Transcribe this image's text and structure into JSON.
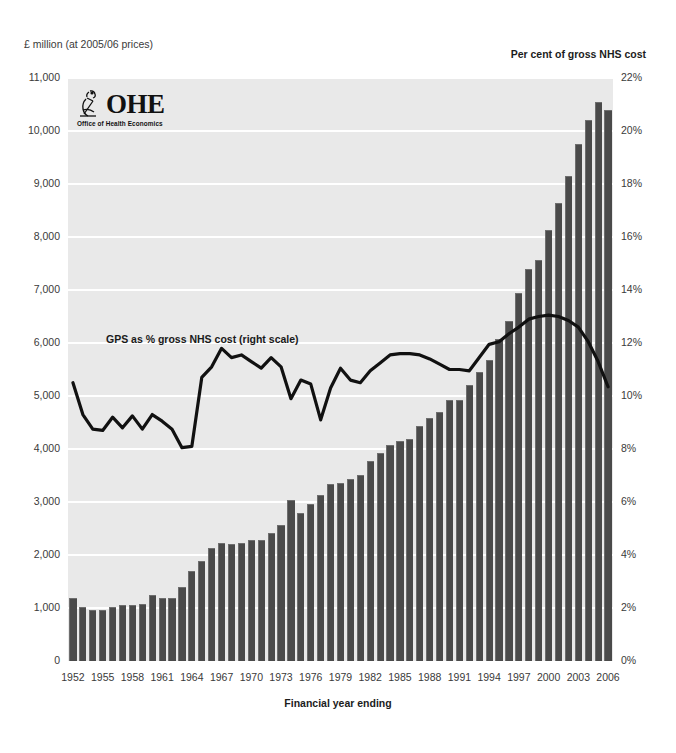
{
  "clipped_header": "",
  "axis": {
    "left_caption": "£ million (at 2005/06 prices)",
    "right_caption": "Per cent of gross NHS cost",
    "x_title": "Financial year ending"
  },
  "logo": {
    "name": "OHE",
    "subtitle": "Office of Health Economics",
    "mark": "microscope-icon"
  },
  "series_label": "GPS as % gross NHS cost (right scale)",
  "colors": {
    "bar": "#4a4a4a",
    "bar_edge": "#6e6e6e",
    "line": "#111111",
    "plot_background": "#e9e9e9",
    "gridline": "#ffffff",
    "text": "#2b2b2b"
  },
  "chart_data": {
    "type": "bar",
    "title": "",
    "subtitle": "",
    "xlabel": "Financial year ending",
    "ylabel": "£ million (at 2005/06 prices)",
    "y2label": "Per cent of gross NHS cost",
    "ylim": [
      0,
      11000
    ],
    "y2lim": [
      0,
      22
    ],
    "yticks": [
      0,
      1000,
      2000,
      3000,
      4000,
      5000,
      6000,
      7000,
      8000,
      9000,
      10000,
      11000
    ],
    "ytick_labels": [
      "0",
      "1,000",
      "2,000",
      "3,000",
      "4,000",
      "5,000",
      "6,000",
      "7,000",
      "8,000",
      "9,000",
      "10,000",
      "11,000"
    ],
    "y2ticks": [
      0,
      2,
      4,
      6,
      8,
      10,
      12,
      14,
      16,
      18,
      20,
      22
    ],
    "y2tick_labels": [
      "0%",
      "2%",
      "4%",
      "6%",
      "8%",
      "10%",
      "12%",
      "14%",
      "16%",
      "18%",
      "20%",
      "22%"
    ],
    "grid": true,
    "legend_position": "inline-annotation",
    "x": [
      1952,
      1953,
      1954,
      1955,
      1956,
      1957,
      1958,
      1959,
      1960,
      1961,
      1962,
      1963,
      1964,
      1965,
      1966,
      1967,
      1968,
      1969,
      1970,
      1971,
      1972,
      1973,
      1974,
      1975,
      1976,
      1977,
      1978,
      1979,
      1980,
      1981,
      1982,
      1983,
      1984,
      1985,
      1986,
      1987,
      1988,
      1989,
      1990,
      1991,
      1992,
      1993,
      1994,
      1995,
      1996,
      1997,
      1998,
      1999,
      2000,
      2001,
      2002,
      2003,
      2004,
      2005,
      2006
    ],
    "xtick_labels": [
      "1952",
      "1955",
      "1958",
      "1961",
      "1964",
      "1967",
      "1970",
      "1973",
      "1976",
      "1979",
      "1982",
      "1985",
      "1988",
      "1991",
      "1994",
      "1997",
      "2000",
      "2003",
      "2006"
    ],
    "series": [
      {
        "name": "General practitioner services cost",
        "type": "bar",
        "axis": "left",
        "unit": "£ million (at 2005/06 prices)",
        "values": [
          1190,
          1020,
          960,
          965,
          1010,
          1055,
          1060,
          1080,
          1250,
          1190,
          1180,
          1400,
          1700,
          1880,
          2140,
          2220,
          2200,
          2230,
          2280,
          2280,
          2420,
          2570,
          3040,
          2790,
          2960,
          3140,
          3340,
          3350,
          3440,
          3510,
          3780,
          3930,
          4070,
          4150,
          4180,
          4430,
          4590,
          4700,
          4930,
          4930,
          5210,
          5450,
          5680,
          6070,
          6410,
          6940,
          7400,
          7560,
          8130,
          8640,
          9160,
          9750,
          10200,
          10550,
          10400
        ]
      },
      {
        "name": "GPS as % gross NHS cost",
        "type": "line",
        "axis": "right",
        "unit": "per cent",
        "values": [
          10.5,
          9.3,
          8.75,
          8.7,
          9.2,
          8.8,
          9.25,
          8.75,
          9.3,
          9.05,
          8.75,
          8.05,
          8.1,
          10.7,
          11.1,
          11.8,
          11.45,
          11.55,
          11.3,
          11.05,
          11.45,
          11.1,
          9.9,
          10.6,
          10.45,
          9.1,
          10.3,
          11.05,
          10.6,
          10.5,
          10.95,
          11.25,
          11.55,
          11.6,
          11.6,
          11.55,
          11.4,
          11.2,
          11.0,
          11.0,
          10.95,
          11.45,
          11.95,
          12.05,
          12.35,
          12.6,
          12.9,
          13.0,
          13.05,
          13.0,
          12.85,
          12.6,
          12.05,
          11.3,
          10.35
        ]
      }
    ]
  }
}
